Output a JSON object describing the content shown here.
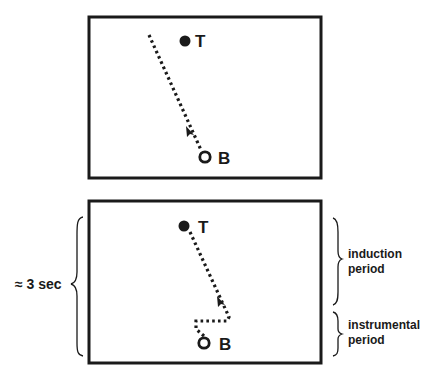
{
  "panels": [
    {
      "id": "top",
      "target_label": "T",
      "base_label": "B",
      "path_description": "straight dotted path from B upward past T",
      "arrow_direction": "up-left"
    },
    {
      "id": "bottom",
      "target_label": "T",
      "base_label": "B",
      "path_description": "dotted path from B, short jog right, then straight toward T",
      "arrow_direction": "up-left"
    }
  ],
  "annotations": {
    "duration_label": "≈ 3 sec",
    "induction": [
      "induction",
      "period"
    ],
    "instrumental": [
      "instrumental",
      "period"
    ]
  },
  "colors": {
    "ink": "#1a1a1a",
    "background": "#ffffff"
  }
}
